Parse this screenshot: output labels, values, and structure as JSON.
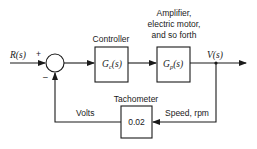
{
  "diagram": {
    "type": "feedback control block diagram",
    "input_signal": "R(s)",
    "output_signal": "V(s)",
    "summing_junction": {
      "plus_sign": "+",
      "minus_sign": "–"
    },
    "blocks": [
      {
        "id": "controller",
        "caption": "Controller",
        "transfer_function": "Gc(s)",
        "tf_main": "G",
        "tf_sub": "c",
        "tf_arg": "(s)"
      },
      {
        "id": "plant",
        "caption_lines": [
          "Amplifier,",
          "electric motor,",
          "and so forth"
        ],
        "transfer_function": "Gp(s)",
        "tf_main": "G",
        "tf_sub": "p",
        "tf_arg": "(s)"
      },
      {
        "id": "tachometer",
        "caption": "Tachometer",
        "gain": "0.02"
      }
    ],
    "edge_labels": {
      "feedback_in": "Speed, rpm",
      "feedback_out": "Volts"
    }
  }
}
